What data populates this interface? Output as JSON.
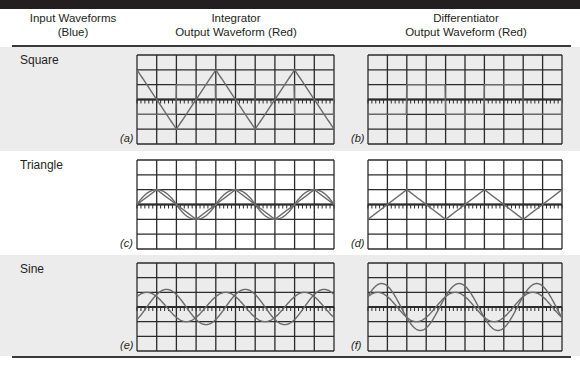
{
  "header": {
    "col_input_line1": "Input Waveforms",
    "col_input_line2": "(Blue)",
    "col_integrator_line1": "Integrator",
    "col_integrator_line2": "Output Waveform (Red)",
    "col_differentiator_line1": "Differentiator",
    "col_differentiator_line2": "Output Waveform (Red)"
  },
  "colors": {
    "grid": "#2b2b2b",
    "trace": "#6a6a6a",
    "band_gray": "#ececec",
    "topbar": "#231f20"
  },
  "grid": {
    "columns": 10,
    "rows": 6,
    "ticks_per_division": 5
  },
  "rows": [
    {
      "label": "Square",
      "integrator_panel": "(a)",
      "differentiator_panel": "(b)"
    },
    {
      "label": "Triangle",
      "integrator_panel": "(c)",
      "differentiator_panel": "(d)"
    },
    {
      "label": "Sine",
      "integrator_panel": "(e)",
      "differentiator_panel": "(f)"
    }
  ]
}
